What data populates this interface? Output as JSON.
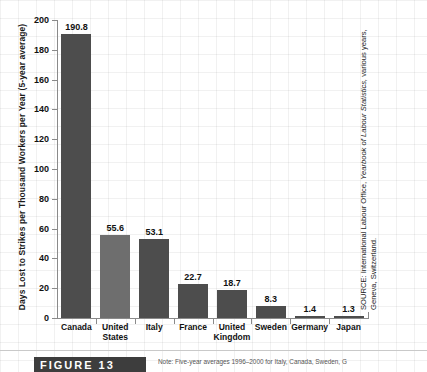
{
  "chart_data": {
    "type": "bar",
    "title": "",
    "xlabel": "",
    "ylabel": "Days Lost to Strikes per Thousand Workers per Year (5-year average)",
    "ylim": [
      0,
      200
    ],
    "yticks": [
      0,
      20,
      40,
      60,
      80,
      100,
      120,
      140,
      160,
      180,
      200
    ],
    "grid": true,
    "legend": "none",
    "categories": [
      "Canada",
      "United States",
      "Italy",
      "France",
      "United Kingdom",
      "Sweden",
      "Germany",
      "Japan"
    ],
    "values": [
      190.8,
      55.6,
      53.1,
      22.7,
      18.7,
      8.3,
      1.4,
      1.3
    ],
    "value_labels": [
      "190.8",
      "55.6",
      "53.1",
      "22.7",
      "18.7",
      "8.3",
      "1.4",
      "1.3"
    ],
    "bar_color": "#4d4d4d",
    "bar_color_alt": "#6e6e6e"
  },
  "figure": {
    "number_label": "FIGURE 13",
    "note": "Note: Five-year averages 1996–2000 for Italy, Canada, Sweden, G"
  },
  "source": {
    "prefix": "SOURCE: International Labour Office,",
    "italic": "Yearbook of Labour Statistics,",
    "suffix": "various years, Geneva, Switzerland."
  }
}
